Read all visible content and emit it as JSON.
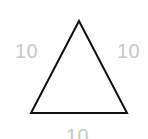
{
  "figure": {
    "name": "equilateral-triangle-with-side-lengths",
    "type": "geometry-diagram",
    "background_color": "#ffffff",
    "shape": {
      "kind": "triangle",
      "classification": "equilateral",
      "stroke_color": "#111111",
      "stroke_width": 2,
      "fill": "none",
      "vertices": {
        "apex": {
          "x": 79,
          "y": 21
        },
        "bottom_left": {
          "x": 31,
          "y": 113
        },
        "bottom_right": {
          "x": 127,
          "y": 113
        }
      }
    },
    "labels": {
      "color": "#c8c8c8",
      "font_size_px": 20,
      "left_side": "10",
      "right_side": "10",
      "bottom_side": "10"
    }
  }
}
